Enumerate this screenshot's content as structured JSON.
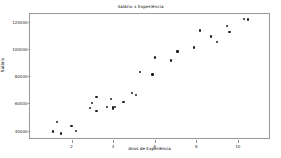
{
  "chart_data": {
    "type": "scatter",
    "title": "Salário x Experiência",
    "xlabel": "Anos de Experiência",
    "ylabel": "Salário",
    "xlim": [
      0.0,
      11.6
    ],
    "ylim": [
      33000,
      126000
    ],
    "grid": false,
    "legend": null,
    "marker": {
      "color": "#1f1f1f",
      "shape": "circle",
      "size_px": 2.2
    },
    "xticks": [
      2,
      4,
      6,
      8,
      10
    ],
    "xtick_labels": [
      "2",
      "4",
      "6",
      "8",
      "10"
    ],
    "yticks": [
      40000,
      60000,
      80000,
      100000,
      120000
    ],
    "ytick_labels": [
      "40000",
      "60000",
      "80000",
      "100000",
      "120000"
    ],
    "series_name": "Salário",
    "x": [
      1.1,
      1.3,
      1.5,
      2.0,
      2.2,
      2.9,
      3.0,
      3.2,
      3.2,
      3.7,
      3.9,
      4.0,
      4.0,
      4.1,
      4.5,
      4.9,
      5.1,
      5.3,
      5.9,
      6.0,
      6.8,
      7.1,
      7.9,
      8.2,
      8.7,
      9.0,
      9.5,
      9.6,
      10.3,
      10.5
    ],
    "y": [
      39343,
      46205,
      37731,
      43525,
      39891,
      56642,
      60150,
      54445,
      64445,
      57189,
      63218,
      55794,
      56957,
      57081,
      61111,
      67938,
      66029,
      83088,
      81363,
      93940,
      91738,
      98273,
      101302,
      113812,
      109431,
      105582,
      116969,
      112635,
      122391,
      121872
    ],
    "n_points": 30
  }
}
